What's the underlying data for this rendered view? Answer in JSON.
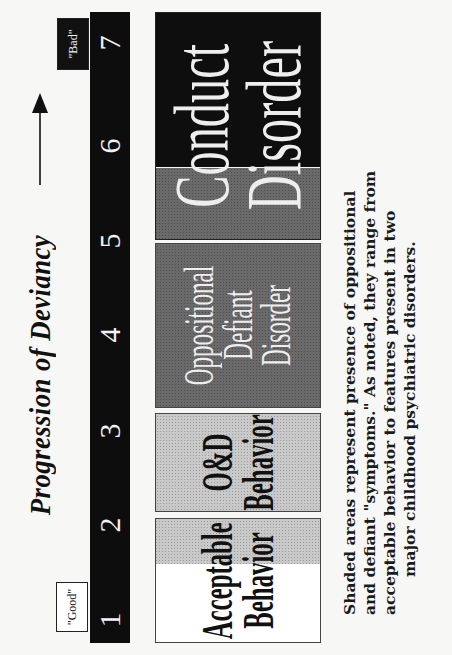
{
  "diagram": {
    "title": "Progression of Deviancy",
    "direction_arrow": "arrow-right",
    "scale": {
      "numbers": [
        "1",
        "2",
        "3",
        "4",
        "5",
        "6",
        "7"
      ],
      "low_label": "\"Good\"",
      "high_label": "\"Bad\""
    },
    "categories": [
      {
        "id": "acceptable",
        "lines": [
          "Acceptable",
          "Behavior"
        ],
        "shade": "none/light",
        "range": "1-2"
      },
      {
        "id": "od-behavior",
        "lines": [
          "O&D",
          "Behavior"
        ],
        "shade": "light",
        "range": "2-3"
      },
      {
        "id": "odd",
        "lines": [
          "Oppositional",
          "Defiant",
          "Disorder"
        ],
        "shade": "dark",
        "range": "3-5"
      },
      {
        "id": "conduct",
        "lines": [
          "Conduct",
          "Disorder"
        ],
        "shade": "dark/black",
        "range": "5-7"
      }
    ],
    "caption": [
      "Shaded areas represent presence of oppositional",
      "and defiant \"symptoms.\" As noted, they range from",
      "acceptable behavior to features present in two",
      "major childhood psychiatric disorders."
    ],
    "colors": {
      "black": "#0d0d0d",
      "dark_gray": "#6a6a6a",
      "light_gray": "#c9c9c9",
      "white": "#ffffff"
    }
  }
}
